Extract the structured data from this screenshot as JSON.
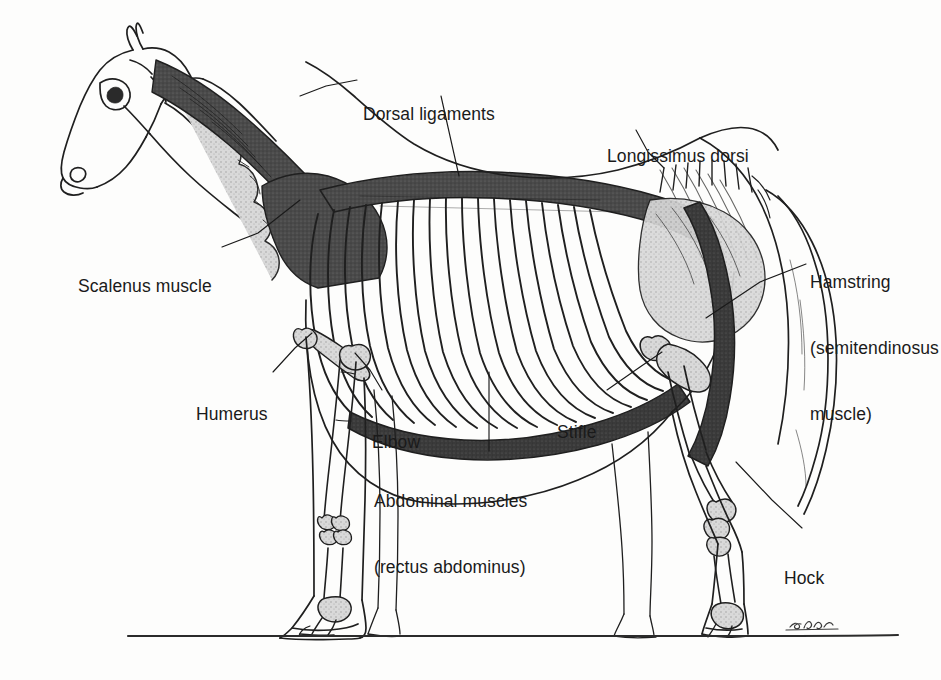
{
  "figure": {
    "background_color": "#fdfdfc",
    "ink_color": "#1a1a1a",
    "signature": "J.S.A."
  },
  "labels": [
    {
      "id": "scalenus-muscle",
      "lines": [
        "Scalenus muscle"
      ],
      "x": 78,
      "y": 240,
      "leader": [
        [
          222,
          247
        ],
        [
          258,
          233
        ],
        [
          300,
          200
        ]
      ]
    },
    {
      "id": "dorsal-ligaments",
      "lines": [
        "Dorsal ligaments"
      ],
      "x": 363,
      "y": 68,
      "leader_left": [
        [
          357,
          80
        ],
        [
          326,
          86
        ],
        [
          300,
          96
        ]
      ],
      "leader_down": [
        [
          441,
          96
        ],
        [
          452,
          145
        ],
        [
          459,
          176
        ]
      ]
    },
    {
      "id": "longissimus-dorsi",
      "lines": [
        "Longissimus dorsi"
      ],
      "x": 607,
      "y": 110,
      "leader": [
        [
          636,
          130
        ],
        [
          648,
          152
        ],
        [
          664,
          168
        ]
      ]
    },
    {
      "id": "hamstring-semitendinosus",
      "lines": [
        "Hamstring",
        "(semitendinosus",
        "muscle)"
      ],
      "x": 810,
      "y": 236,
      "leader": [
        [
          806,
          264
        ],
        [
          760,
          282
        ],
        [
          706,
          318
        ]
      ]
    },
    {
      "id": "humerus",
      "lines": [
        "Humerus"
      ],
      "x": 196,
      "y": 368,
      "leader": [
        [
          273,
          372
        ],
        [
          295,
          348
        ],
        [
          312,
          333
        ]
      ]
    },
    {
      "id": "elbow",
      "lines": [
        "Elbow"
      ],
      "x": 372,
      "y": 396,
      "leader": [
        [
          382,
          390
        ],
        [
          370,
          370
        ],
        [
          355,
          353
        ]
      ]
    },
    {
      "id": "abdominal-muscles",
      "lines": [
        "Abdominal muscles",
        "(rectus abdominus)"
      ],
      "x": 374,
      "y": 455,
      "leader": [
        [
          489,
          451
        ],
        [
          489,
          410
        ],
        [
          489,
          372
        ]
      ]
    },
    {
      "id": "stifle",
      "lines": [
        "Stifle"
      ],
      "x": 557,
      "y": 386,
      "leader": [
        [
          607,
          390
        ],
        [
          640,
          367
        ],
        [
          662,
          352
        ]
      ]
    },
    {
      "id": "hock",
      "lines": [
        "Hock"
      ],
      "x": 784,
      "y": 532,
      "leader": [
        [
          802,
          528
        ],
        [
          772,
          500
        ],
        [
          736,
          462
        ]
      ]
    }
  ],
  "anatomy_regions": [
    {
      "id": "nuchal-ligament",
      "label": "dorsal ligament / nuchal band",
      "tone": "#3c3c3c"
    },
    {
      "id": "trapezius-shoulder-mass",
      "label": "shoulder muscle mass",
      "tone": "#4a4a4a"
    },
    {
      "id": "longissimus-band",
      "label": "longissimus dorsi band",
      "tone": "#4a4a4a"
    },
    {
      "id": "ribcage",
      "label": "rib cage",
      "rib_count": 18,
      "tone": "#2b2b2b"
    },
    {
      "id": "cervical-vertebrae",
      "label": "cervical vertebral chain",
      "tone": "#b8b8b8"
    },
    {
      "id": "abdominal-band",
      "label": "rectus abdominus band",
      "tone": "#3a3a3a"
    },
    {
      "id": "hamstring-band",
      "label": "hamstring band",
      "tone": "#3c3c3c"
    },
    {
      "id": "ground-line",
      "label": "ground line",
      "tone": "#2b2b2b"
    }
  ]
}
